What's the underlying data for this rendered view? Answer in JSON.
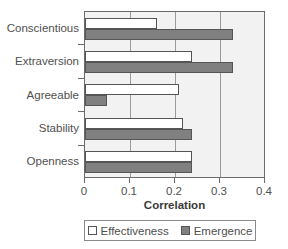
{
  "chart_data": {
    "type": "bar",
    "orientation": "horizontal",
    "title": "",
    "xlabel": "Correlation",
    "ylabel": "",
    "xlim": [
      0,
      0.4
    ],
    "xticks": [
      "0",
      "0.1",
      "0.2",
      "0.3",
      "0.4"
    ],
    "xtick_values": [
      0,
      0.1,
      0.2,
      0.3,
      0.4
    ],
    "grid": true,
    "grid_axis": "x",
    "legend_position": "bottom",
    "categories": [
      "Conscientious",
      "Extraversion",
      "Agreeable",
      "Stability",
      "Openness"
    ],
    "series": [
      {
        "name": "Effectiveness",
        "color": "#ffffff",
        "values": [
          0.16,
          0.24,
          0.21,
          0.22,
          0.24
        ]
      },
      {
        "name": "Emergence",
        "color": "#808080",
        "values": [
          0.33,
          0.33,
          0.05,
          0.24,
          0.24
        ]
      }
    ]
  },
  "legend": {
    "entries": [
      {
        "label": "Effectiveness",
        "swatch": "white-square-icon"
      },
      {
        "label": "Emergence",
        "swatch": "gray-square-icon"
      }
    ]
  },
  "axis": {
    "x_title": "Correlation"
  }
}
